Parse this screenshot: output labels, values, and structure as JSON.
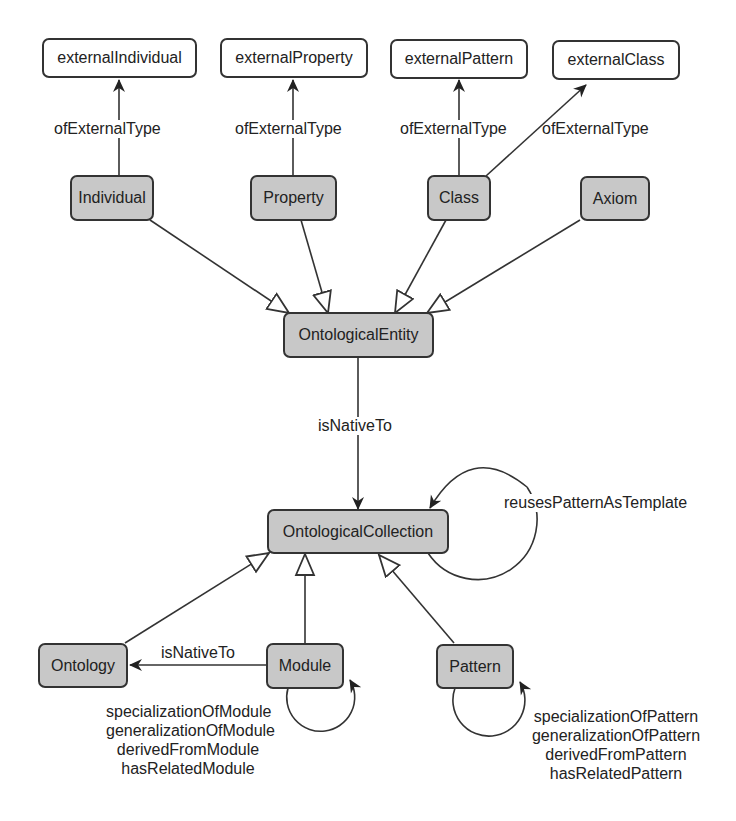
{
  "diagram": {
    "type": "ontology-class-diagram",
    "nodes": {
      "external_individual": {
        "label": "externalIndividual",
        "style": "external"
      },
      "external_property": {
        "label": "externalProperty",
        "style": "external"
      },
      "external_pattern": {
        "label": "externalPattern",
        "style": "external"
      },
      "external_class": {
        "label": "externalClass",
        "style": "external"
      },
      "individual": {
        "label": "Individual",
        "style": "class"
      },
      "property": {
        "label": "Property",
        "style": "class"
      },
      "class": {
        "label": "Class",
        "style": "class"
      },
      "axiom": {
        "label": "Axiom",
        "style": "class"
      },
      "ontological_entity": {
        "label": "OntologicalEntity",
        "style": "class"
      },
      "ontological_collection": {
        "label": "OntologicalCollection",
        "style": "class"
      },
      "ontology": {
        "label": "Ontology",
        "style": "class"
      },
      "module": {
        "label": "Module",
        "style": "class"
      },
      "pattern": {
        "label": "Pattern",
        "style": "class"
      }
    },
    "edge_labels": {
      "of_external_type_individual": "ofExternalType",
      "of_external_type_property": "ofExternalType",
      "of_external_type_pattern": "ofExternalType",
      "of_external_type_class": "ofExternalType",
      "is_native_to_entity": "isNativeTo",
      "reuses_pattern_as_template": "reusesPatternAsTemplate",
      "is_native_to_module": "isNativeTo",
      "module_self": [
        "specializationOfModule",
        "generalizationOfModule",
        "derivedFromModule",
        "hasRelatedModule"
      ],
      "pattern_self": [
        "specializationOfPattern",
        "generalizationOfPattern",
        "derivedFromPattern",
        "hasRelatedPattern"
      ]
    },
    "edges": [
      {
        "from": "Individual",
        "to": "externalIndividual",
        "label": "ofExternalType",
        "kind": "association"
      },
      {
        "from": "Property",
        "to": "externalProperty",
        "label": "ofExternalType",
        "kind": "association"
      },
      {
        "from": "Class",
        "to": "externalPattern",
        "label": "ofExternalType",
        "kind": "association"
      },
      {
        "from": "Class",
        "to": "externalClass",
        "label": "ofExternalType",
        "kind": "association"
      },
      {
        "from": "Individual",
        "to": "OntologicalEntity",
        "kind": "subclass"
      },
      {
        "from": "Property",
        "to": "OntologicalEntity",
        "kind": "subclass"
      },
      {
        "from": "Class",
        "to": "OntologicalEntity",
        "kind": "subclass"
      },
      {
        "from": "Axiom",
        "to": "OntologicalEntity",
        "kind": "subclass"
      },
      {
        "from": "OntologicalEntity",
        "to": "OntologicalCollection",
        "label": "isNativeTo",
        "kind": "association"
      },
      {
        "from": "OntologicalCollection",
        "to": "OntologicalCollection",
        "label": "reusesPatternAsTemplate",
        "kind": "self"
      },
      {
        "from": "Ontology",
        "to": "OntologicalCollection",
        "kind": "subclass"
      },
      {
        "from": "Module",
        "to": "OntologicalCollection",
        "kind": "subclass"
      },
      {
        "from": "Pattern",
        "to": "OntologicalCollection",
        "kind": "subclass"
      },
      {
        "from": "Module",
        "to": "Ontology",
        "label": "isNativeTo",
        "kind": "association"
      },
      {
        "from": "Module",
        "to": "Module",
        "label": "specializationOfModule / generalizationOfModule / derivedFromModule / hasRelatedModule",
        "kind": "self"
      },
      {
        "from": "Pattern",
        "to": "Pattern",
        "label": "specializationOfPattern / generalizationOfPattern / derivedFromPattern / hasRelatedPattern",
        "kind": "self"
      }
    ],
    "colors": {
      "class_fill": "#c8c8c8",
      "external_fill": "#ffffff",
      "stroke": "#333333",
      "text": "#222222"
    }
  }
}
